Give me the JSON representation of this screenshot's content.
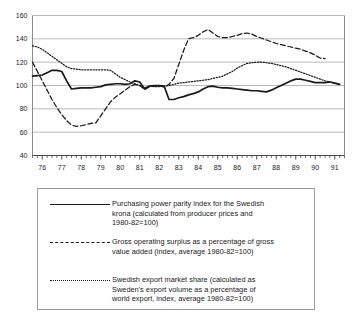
{
  "chart_data": {
    "type": "line",
    "title": "",
    "xlabel": "",
    "ylabel": "",
    "xlim": [
      1975.5,
      1991.5
    ],
    "ylim": [
      40,
      160
    ],
    "grid": true,
    "legend_position": "below-plot",
    "y_ticks": [
      40,
      60,
      80,
      100,
      120,
      140,
      160
    ],
    "x_ticks": [
      "76",
      "77",
      "78",
      "79",
      "80",
      "81",
      "82",
      "83",
      "84",
      "85",
      "86",
      "87",
      "88",
      "89",
      "90",
      "91"
    ],
    "x_minor_tick_interval": "quarterly",
    "x": [
      1975.5,
      1975.75,
      1976.0,
      1976.25,
      1976.5,
      1976.75,
      1977.0,
      1977.25,
      1977.5,
      1977.75,
      1978.0,
      1978.25,
      1978.5,
      1978.75,
      1979.0,
      1979.25,
      1979.5,
      1979.75,
      1980.0,
      1980.25,
      1980.5,
      1980.75,
      1981.0,
      1981.25,
      1981.5,
      1981.75,
      1982.0,
      1982.25,
      1982.5,
      1982.75,
      1983.0,
      1983.25,
      1983.5,
      1983.75,
      1984.0,
      1984.25,
      1984.5,
      1984.75,
      1985.0,
      1985.25,
      1985.5,
      1985.75,
      1986.0,
      1986.25,
      1986.5,
      1986.75,
      1987.0,
      1987.25,
      1987.5,
      1987.75,
      1988.0,
      1988.25,
      1988.5,
      1988.75,
      1989.0,
      1989.25,
      1989.5,
      1989.75,
      1990.0,
      1990.25,
      1990.5,
      1990.75,
      1991.0,
      1991.25
    ],
    "series": [
      {
        "name": "Purchasing power parity index for the Swedish krona",
        "style": "solid",
        "color": "#1a1a1a",
        "values": [
          108,
          108.5,
          109,
          111,
          113,
          113,
          112,
          104,
          97,
          97.5,
          98,
          98,
          98,
          98.5,
          99,
          100.5,
          101,
          101.5,
          101.5,
          101,
          101.5,
          104,
          103,
          97,
          99.5,
          100,
          100,
          99.5,
          88,
          88,
          89.5,
          90.5,
          92,
          93,
          94.5,
          97,
          99,
          99.5,
          98.5,
          98,
          98,
          97.5,
          97,
          96.5,
          96,
          95.5,
          95.5,
          95,
          94.5,
          96,
          98,
          100,
          102,
          104,
          105.5,
          105.5,
          104.5,
          103.5,
          102.5,
          102.5,
          102.5,
          103,
          102,
          101
        ]
      },
      {
        "name": "Gross operating surplus as a percentage of gross value added",
        "style": "dashed",
        "color": "#1a1a1a",
        "values": [
          120,
          112,
          104,
          96,
          88,
          81,
          75,
          70,
          66,
          65,
          65.5,
          66.5,
          67.5,
          68,
          74,
          80,
          86,
          90,
          93,
          96,
          99,
          101,
          100,
          96.5,
          99,
          99.5,
          100,
          98.5,
          101,
          106,
          118,
          130,
          140,
          141,
          143,
          146,
          148,
          145,
          142,
          141,
          141,
          142,
          143,
          144.5,
          145,
          144,
          142,
          140.5,
          139,
          137.5,
          136,
          135,
          134,
          133,
          132,
          131,
          129.5,
          128,
          126,
          123.5,
          123,
          null,
          null,
          null
        ]
      },
      {
        "name": "Swedish export market share",
        "style": "dotted",
        "color": "#1a1a1a",
        "values": [
          134,
          133,
          131,
          128,
          125,
          122,
          119,
          116,
          114.5,
          114,
          113.5,
          113.5,
          113.5,
          113.5,
          113.5,
          113.5,
          113,
          110,
          107,
          105,
          103,
          101.5,
          100,
          98,
          99.5,
          99,
          99,
          99.5,
          100,
          101,
          102,
          102.5,
          103,
          103.5,
          104,
          104.5,
          105,
          106,
          107,
          108,
          110,
          112,
          115,
          117,
          119,
          119.5,
          120,
          120,
          119.5,
          119,
          118,
          117,
          116,
          114.5,
          113,
          111.5,
          110,
          108.5,
          107,
          105.5,
          104,
          103,
          102,
          101
        ]
      }
    ]
  },
  "legend": {
    "entries": [
      {
        "key": "solid",
        "text": "Purchasing power parity index for the Swedish\nkrona (calculated from producer prices and\n1980-82=100)"
      },
      {
        "key": "dashed",
        "text": "Gross operating surplus as a percentage of gross\nvalue added (index, average 1980-82=100)"
      },
      {
        "key": "dotted",
        "text": "Swedish export market share (calculated as\nSweden's export volume as a percentage of\nworld export, index, average 1980-82=100)"
      }
    ]
  },
  "colors": {
    "line": "#1a1a1a",
    "grid": "#b9b9b9",
    "axis": "#8a8a8a",
    "background": "#ffffff"
  }
}
